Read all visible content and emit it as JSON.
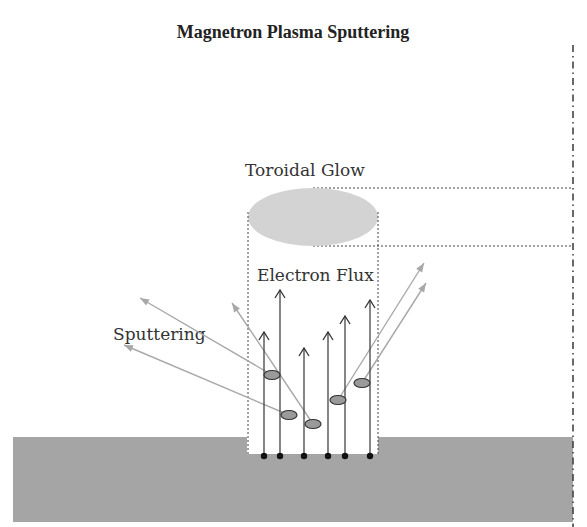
{
  "title": "Magnetron Plasma Sputtering",
  "labels": {
    "glow": "Toroidal Glow",
    "electron_flux": "Electron Flux",
    "sputtering": "Sputtering"
  },
  "colors": {
    "substrate": "#a5a5a5",
    "glow": "#d3d3d3",
    "particle": "#9a9a9a",
    "electron_arrow": "#444444",
    "sputter_arrow": "#a8a8a8",
    "dotted_line": "#444444"
  },
  "diagram": {
    "electron_arrows": [
      {
        "x": 264,
        "y_top": 332
      },
      {
        "x": 280,
        "y_top": 290
      },
      {
        "x": 304,
        "y_top": 348
      },
      {
        "x": 328,
        "y_top": 332
      },
      {
        "x": 345,
        "y_top": 316
      },
      {
        "x": 370,
        "y_top": 300
      }
    ],
    "particles": [
      {
        "cx": 272,
        "cy": 375
      },
      {
        "cx": 289,
        "cy": 415
      },
      {
        "cx": 313,
        "cy": 424
      },
      {
        "cx": 338,
        "cy": 400
      },
      {
        "cx": 362,
        "cy": 383
      }
    ],
    "sputter_arrows": [
      {
        "from": [
          272,
          375
        ],
        "to": [
          140,
          298
        ]
      },
      {
        "from": [
          289,
          415
        ],
        "to": [
          124,
          345
        ]
      },
      {
        "from": [
          313,
          424
        ],
        "to": [
          232,
          303
        ]
      },
      {
        "from": [
          338,
          400
        ],
        "to": [
          424,
          263
        ]
      },
      {
        "from": [
          362,
          383
        ],
        "to": [
          426,
          283
        ]
      }
    ]
  }
}
